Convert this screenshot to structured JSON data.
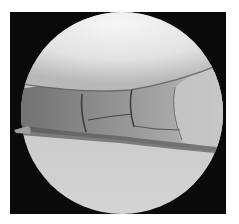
{
  "image": {
    "kind": "arthroscopic-view",
    "colors": {
      "frame": "#0a0a0a",
      "upper_surface": "#e6e6e6",
      "lower_surface": "#c9c9c9",
      "tissue": "#8a8a8a",
      "tissue_dark": "#4a4a4a",
      "tissue_light": "#bdbdbd"
    }
  }
}
